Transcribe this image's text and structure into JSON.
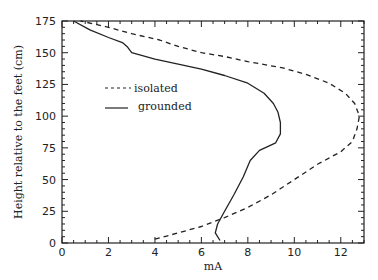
{
  "chart_data": {
    "type": "line",
    "title": "",
    "xlabel": "mA",
    "ylabel": "Height relative to the feet (cm)",
    "xlim": [
      0,
      13
    ],
    "ylim": [
      0,
      175
    ],
    "xticks": [
      0,
      2,
      4,
      6,
      8,
      10,
      12
    ],
    "yticks": [
      0,
      25,
      50,
      75,
      100,
      125,
      150,
      175
    ],
    "grid": false,
    "legend_position": "upper-left-inside",
    "series": [
      {
        "name": "isolated",
        "style": "dashed",
        "points": [
          [
            4.0,
            3
          ],
          [
            5.0,
            8
          ],
          [
            6.0,
            13
          ],
          [
            7.0,
            20
          ],
          [
            8.0,
            28
          ],
          [
            9.0,
            38
          ],
          [
            10.0,
            50
          ],
          [
            11.0,
            62
          ],
          [
            12.0,
            72
          ],
          [
            12.5,
            80
          ],
          [
            12.7,
            90
          ],
          [
            12.8,
            100
          ],
          [
            12.6,
            110
          ],
          [
            12.2,
            118
          ],
          [
            11.5,
            126
          ],
          [
            10.5,
            133
          ],
          [
            9.5,
            138
          ],
          [
            8.0,
            143
          ],
          [
            7.0,
            147
          ],
          [
            6.0,
            150
          ],
          [
            5.0,
            155
          ],
          [
            4.2,
            160
          ],
          [
            3.0,
            165
          ],
          [
            2.0,
            170
          ],
          [
            0.8,
            175
          ]
        ]
      },
      {
        "name": "grounded",
        "style": "solid",
        "points": [
          [
            6.8,
            2
          ],
          [
            6.6,
            8
          ],
          [
            6.7,
            15
          ],
          [
            7.0,
            25
          ],
          [
            7.4,
            38
          ],
          [
            7.8,
            52
          ],
          [
            8.1,
            65
          ],
          [
            8.5,
            73
          ],
          [
            9.2,
            79
          ],
          [
            9.4,
            86
          ],
          [
            9.4,
            95
          ],
          [
            9.3,
            103
          ],
          [
            9.1,
            110
          ],
          [
            8.7,
            118
          ],
          [
            8.0,
            126
          ],
          [
            7.0,
            132
          ],
          [
            6.0,
            137
          ],
          [
            5.0,
            141
          ],
          [
            4.0,
            145
          ],
          [
            3.0,
            150
          ],
          [
            2.8,
            155
          ],
          [
            2.6,
            158
          ],
          [
            2.0,
            162
          ],
          [
            1.2,
            168
          ],
          [
            0.5,
            175
          ]
        ]
      }
    ]
  },
  "legend": {
    "isolated_label": "isolated",
    "grounded_label": "grounded"
  }
}
